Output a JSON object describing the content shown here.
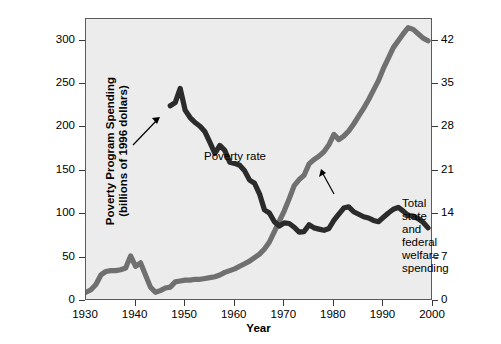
{
  "chart_data": {
    "type": "line",
    "title": "",
    "xlabel": "Year",
    "ylabel": "Poverty Program Spending\n(billions of 1996 dollars)",
    "ylabel_right": "Poverty Rate (percent)",
    "xlim": [
      1930,
      2000
    ],
    "ylim": [
      0,
      325
    ],
    "ylim_right": [
      0,
      45.5
    ],
    "xticks": [
      1930,
      1940,
      1950,
      1960,
      1970,
      1980,
      1990,
      2000
    ],
    "yticks_left": [
      0,
      50,
      100,
      150,
      200,
      250,
      300
    ],
    "yticks_right": [
      0,
      7,
      14,
      21,
      28,
      35,
      42
    ],
    "grid": false,
    "legend": "inline-annotations",
    "background": "#ececec",
    "series": [
      {
        "name": "Total state and federal welfare spending",
        "axis": "left",
        "color": "#707070",
        "units": "billions of 1996 dollars",
        "x": [
          1930,
          1931,
          1932,
          1933,
          1934,
          1935,
          1936,
          1937,
          1938,
          1939,
          1940,
          1941,
          1942,
          1943,
          1944,
          1945,
          1946,
          1947,
          1948,
          1949,
          1950,
          1951,
          1952,
          1953,
          1954,
          1955,
          1956,
          1957,
          1958,
          1959,
          1960,
          1961,
          1962,
          1963,
          1964,
          1965,
          1966,
          1967,
          1968,
          1969,
          1970,
          1971,
          1972,
          1973,
          1974,
          1975,
          1976,
          1977,
          1978,
          1979,
          1980,
          1981,
          1982,
          1983,
          1984,
          1985,
          1986,
          1987,
          1988,
          1989,
          1990,
          1991,
          1992,
          1993,
          1994,
          1995,
          1996,
          1997,
          1998,
          1999
        ],
        "y": [
          10,
          13,
          19,
          30,
          34,
          35,
          35,
          36,
          38,
          52,
          40,
          44,
          30,
          16,
          10,
          12,
          15,
          16,
          22,
          23,
          24,
          24,
          25,
          25,
          26,
          27,
          28,
          30,
          33,
          35,
          37,
          40,
          43,
          46,
          50,
          54,
          60,
          68,
          80,
          92,
          104,
          118,
          133,
          140,
          145,
          158,
          163,
          167,
          172,
          180,
          192,
          186,
          190,
          196,
          204,
          213,
          222,
          232,
          243,
          254,
          268,
          280,
          292,
          300,
          308,
          315,
          313,
          308,
          303,
          300
        ]
      },
      {
        "name": "Poverty rate",
        "axis": "right",
        "color": "#2b2b2b",
        "units": "percent",
        "x": [
          1947,
          1948,
          1949,
          1950,
          1951,
          1952,
          1953,
          1954,
          1955,
          1956,
          1957,
          1958,
          1959,
          1960,
          1961,
          1962,
          1963,
          1964,
          1965,
          1966,
          1967,
          1968,
          1969,
          1970,
          1971,
          1972,
          1973,
          1974,
          1975,
          1976,
          1977,
          1978,
          1979,
          1980,
          1981,
          1982,
          1983,
          1984,
          1985,
          1986,
          1987,
          1988,
          1989,
          1990,
          1991,
          1992,
          1993,
          1994,
          1995,
          1996,
          1997,
          1998,
          1999
        ],
        "y": [
          31.5,
          32.0,
          34.3,
          30.8,
          29.6,
          28.8,
          28.2,
          27.3,
          25.6,
          23.8,
          25.1,
          24.3,
          22.4,
          22.2,
          21.9,
          21.0,
          19.5,
          19.0,
          17.3,
          14.7,
          14.2,
          12.8,
          12.1,
          12.6,
          12.5,
          11.9,
          11.1,
          11.2,
          12.3,
          11.8,
          11.6,
          11.4,
          11.7,
          13.0,
          14.0,
          15.0,
          15.2,
          14.4,
          14.0,
          13.6,
          13.4,
          13.0,
          12.8,
          13.5,
          14.2,
          14.8,
          15.1,
          14.5,
          13.8,
          13.7,
          13.3,
          12.7,
          11.8
        ]
      }
    ],
    "annotations": [
      {
        "name": "poverty-rate",
        "text": "Poverty rate",
        "arrow": true
      },
      {
        "name": "welfare-spending",
        "text": "Total state and\nfederal welfare spending",
        "arrow": true
      }
    ]
  },
  "axes": {
    "x": {
      "label": "Year",
      "ticks": [
        "1930",
        "1940",
        "1950",
        "1960",
        "1970",
        "1980",
        "1990",
        "2000"
      ]
    },
    "y_left": {
      "label_line1": "Poverty Program Spending",
      "label_line2": "(billions of 1996 dollars)",
      "ticks": [
        "0",
        "50",
        "100",
        "150",
        "200",
        "250",
        "300"
      ]
    },
    "y_right": {
      "label": "Poverty Rate (percent)",
      "ticks": [
        "0",
        "7",
        "14",
        "21",
        "28",
        "35",
        "42"
      ]
    }
  },
  "annotations": {
    "poverty_rate": "Poverty rate",
    "welfare_line1": "Total state and",
    "welfare_line2": "federal welfare spending"
  },
  "colors": {
    "spending_line": "#707070",
    "poverty_line": "#2b2b2b",
    "plot_background": "#ececec",
    "frame": "#5a5a5a"
  }
}
